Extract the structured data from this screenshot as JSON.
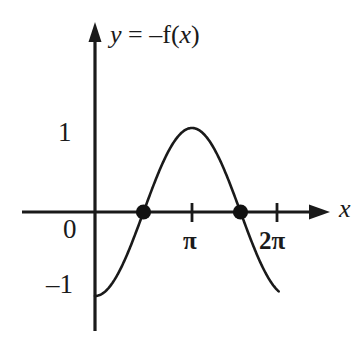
{
  "figure": {
    "kind": "cartesian-graph",
    "background_color": "#ffffff",
    "ink_color": "#1a1a1a"
  },
  "equation_label": {
    "full_text": "y = –f(x)",
    "lhs_variable": "y",
    "equals": " = ",
    "minus_sign": "–",
    "function_name": "f",
    "open_paren": "(",
    "argument": "x",
    "close_paren": ")"
  },
  "axes": {
    "x_axis": {
      "label": "x",
      "arrow": true,
      "ticks": [
        {
          "name": "pi",
          "label": "π",
          "value": 3.14159
        },
        {
          "name": "two-pi",
          "label": "2π",
          "value": 6.28319
        }
      ]
    },
    "y_axis": {
      "label": "",
      "arrow": true,
      "ticks": [
        {
          "name": "one",
          "label": "1",
          "value": 1
        },
        {
          "name": "zero",
          "label": "0",
          "value": 0
        },
        {
          "name": "negative-one",
          "label": "–1",
          "value": -1
        }
      ]
    }
  },
  "markers": [
    {
      "name": "left-root",
      "label": "",
      "x": 1.5708,
      "y": 0
    },
    {
      "name": "right-root",
      "label": "",
      "x": 4.7124,
      "y": 0
    }
  ],
  "chart_data": {
    "type": "line",
    "title": "",
    "subtitle": "",
    "xlabel": "x",
    "ylabel": "",
    "annotations": [
      "y = –f(x)"
    ],
    "legend": [],
    "legend_position": "none",
    "grid": false,
    "xlim": [
      -0.55,
      6.95
    ],
    "ylim": [
      -1.45,
      1.65
    ],
    "x_ticks": [
      3.14159,
      6.28319
    ],
    "x_tick_labels": [
      "π",
      "2π"
    ],
    "y_ticks": [
      -1,
      0,
      1
    ],
    "y_tick_labels": [
      "–1",
      "0",
      "1"
    ],
    "series": [
      {
        "name": "y = -cos(x)",
        "expression": "y = −cos(x)",
        "color": "#1a1a1a",
        "x_start": 0.0,
        "x_end": 5.95,
        "x": [
          0.0,
          0.3,
          0.6,
          0.9,
          1.2,
          1.5708,
          1.9,
          2.2,
          2.5,
          2.8,
          3.14159,
          3.5,
          3.8,
          4.1,
          4.4,
          4.7124,
          5.0,
          5.3,
          5.6,
          5.95
        ],
        "values": [
          -1.0,
          -0.955,
          -0.825,
          -0.622,
          -0.362,
          0.0,
          0.323,
          0.589,
          0.801,
          0.942,
          1.0,
          0.936,
          0.791,
          0.575,
          0.307,
          0.0,
          -0.284,
          -0.554,
          -0.776,
          -0.948
        ]
      }
    ],
    "points_of_interest": [
      {
        "label": "root",
        "x": 1.5708,
        "y": 0
      },
      {
        "label": "root",
        "x": 4.7124,
        "y": 0
      },
      {
        "label": "maximum",
        "x": 3.14159,
        "y": 1
      },
      {
        "label": "minimum",
        "x": 0,
        "y": -1
      }
    ]
  }
}
